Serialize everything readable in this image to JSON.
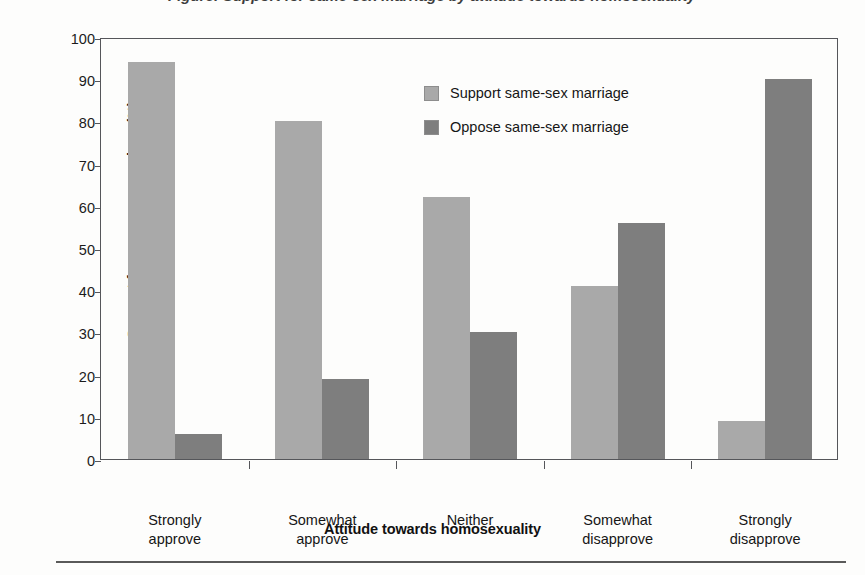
{
  "figure": {
    "title_clipped": "Figure: Support for same-sex marriage by attitude towards homosexuality",
    "background_color": "#fdfdfc"
  },
  "chart_data": {
    "type": "bar",
    "title": "",
    "xlabel": "Attitude towards homosexuality",
    "ylabel": "Support for same-sex marriage (%)",
    "categories": [
      "Strongly approve",
      "Somewhat approve",
      "Neither",
      "Somewhat disapprove",
      "Strongly disapprove"
    ],
    "series": [
      {
        "name": "Support same-sex marriage",
        "color": "#a9a9a9",
        "values": [
          94,
          80,
          62,
          41,
          9
        ]
      },
      {
        "name": "Oppose same-sex marriage",
        "color": "#7e7e7e",
        "values": [
          6,
          19,
          30,
          56,
          90
        ]
      }
    ],
    "ylim": [
      0,
      100
    ],
    "yticks": [
      0,
      10,
      20,
      30,
      40,
      50,
      60,
      70,
      80,
      90,
      100
    ],
    "ytick_labels": [
      "0",
      "10",
      "20",
      "30",
      "40",
      "50",
      "60",
      "70",
      "80",
      "90",
      "100"
    ],
    "grid": false,
    "legend_position": "upper center",
    "legend_entries": [
      "Support same-sex marriage",
      "Oppose same-sex marriage"
    ]
  },
  "axis": {
    "frame_color": "#55565a"
  }
}
